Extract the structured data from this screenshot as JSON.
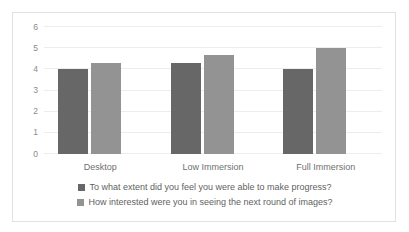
{
  "chart_data": {
    "type": "bar",
    "title": "",
    "subtitle": "",
    "xlabel": "",
    "ylabel": "",
    "categories": [
      "Desktop",
      "Low Immersion",
      "Full Immersion"
    ],
    "ylim": [
      0,
      6
    ],
    "yticks": [
      "0",
      "1",
      "2",
      "3",
      "4",
      "5",
      "6"
    ],
    "grid": "horizontal",
    "legend_position": "bottom",
    "series": [
      {
        "name": "To what extent did you feel you were able to make progress?",
        "color": "#676767",
        "values": [
          4.0,
          4.3,
          4.0
        ]
      },
      {
        "name": "How interested were you in seeing the next round of images?",
        "color": "#939393",
        "values": [
          4.3,
          4.7,
          5.0
        ]
      }
    ]
  },
  "style": {
    "frame_border_color": "#e2e2e2",
    "gridline_color": "#ededed",
    "tick_text_color": "#8a8a8a",
    "category_text_color": "#6f6f6f",
    "legend_text_color": "#5f5f5f",
    "plot_background": "#ffffff"
  }
}
